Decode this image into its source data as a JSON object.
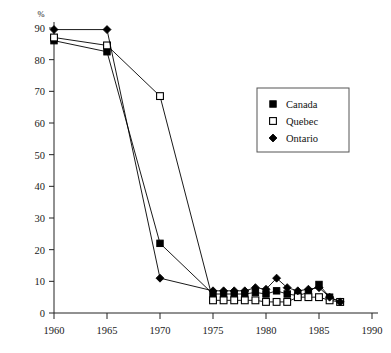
{
  "chart_data": {
    "type": "line",
    "title": "",
    "xlabel": "",
    "ylabel": "",
    "yunit": "%",
    "xlim": [
      1960,
      1990
    ],
    "ylim": [
      0,
      90
    ],
    "xticks": [
      1960,
      1965,
      1970,
      1975,
      1980,
      1985,
      1990
    ],
    "yticks": [
      0,
      10,
      20,
      30,
      40,
      50,
      60,
      70,
      80,
      90
    ],
    "grid": false,
    "legend_position": "upper-right",
    "series": [
      {
        "name": "Canada",
        "marker": "filled-square",
        "color": "#000000",
        "x": [
          1960,
          1965,
          1970,
          1975,
          1976,
          1977,
          1978,
          1979,
          1980,
          1981,
          1982,
          1983,
          1984,
          1985,
          1986,
          1987
        ],
        "values": [
          86,
          82.5,
          22,
          6,
          6,
          6,
          6,
          6.5,
          6,
          7,
          6,
          5.5,
          6.5,
          9,
          5,
          3.5
        ]
      },
      {
        "name": "Quebec",
        "marker": "open-square",
        "color": "#000000",
        "x": [
          1960,
          1965,
          1970,
          1975,
          1976,
          1977,
          1978,
          1979,
          1980,
          1981,
          1982,
          1983,
          1984,
          1985,
          1986,
          1987
        ],
        "values": [
          87,
          84.5,
          68.5,
          4,
          4,
          4,
          4,
          4,
          3.5,
          3.5,
          3.5,
          5,
          5,
          5,
          4,
          3.5
        ]
      },
      {
        "name": "Ontario",
        "marker": "filled-diamond",
        "color": "#000000",
        "x": [
          1960,
          1965,
          1970,
          1975,
          1976,
          1977,
          1978,
          1979,
          1980,
          1981,
          1982,
          1983,
          1984,
          1985,
          1986,
          1987
        ],
        "values": [
          89.5,
          89.5,
          11,
          7,
          7,
          7,
          7,
          8,
          7.5,
          11,
          8,
          7,
          7.5,
          8,
          5,
          3.5
        ]
      }
    ]
  },
  "legend": {
    "entries": [
      {
        "label": "Canada"
      },
      {
        "label": "Quebec"
      },
      {
        "label": "Ontario"
      }
    ]
  }
}
